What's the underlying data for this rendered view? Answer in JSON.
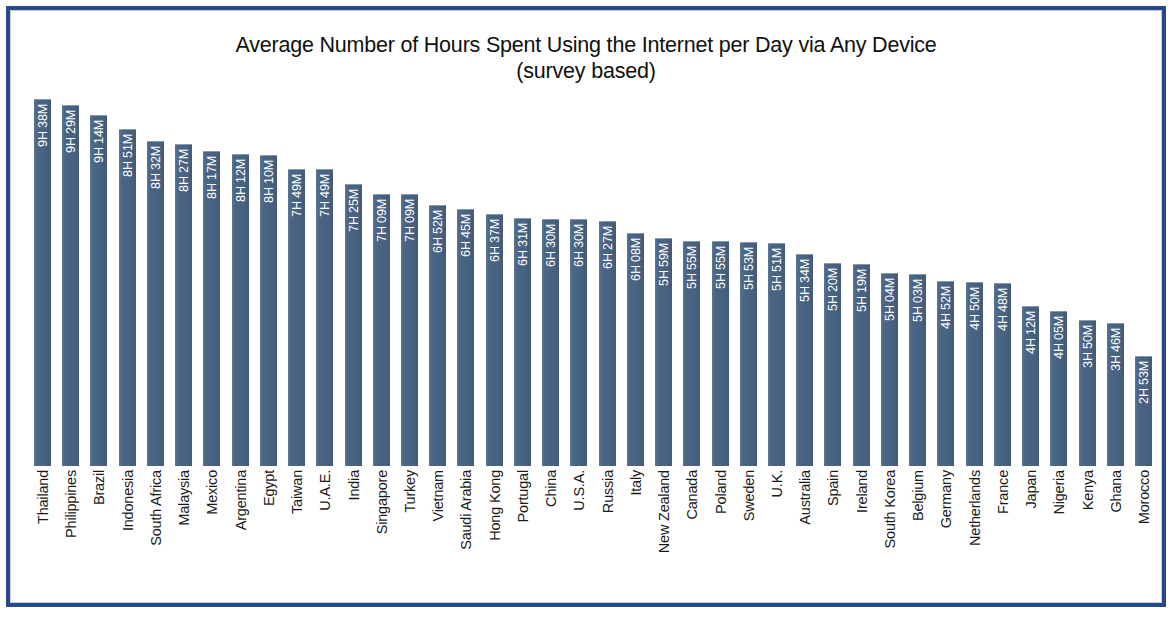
{
  "chart_data": {
    "type": "bar",
    "title": "Average Number of Hours Spent Using the Internet per Day via Any Device",
    "subtitle": "(survey based)",
    "xlabel": "",
    "ylabel": "",
    "orientation": "vertical",
    "grid": false,
    "legend": null,
    "value_label_position": "inside-bar-rotated",
    "ylim_hours": [
      0,
      10
    ],
    "categories": [
      "Thailand",
      "Philippines",
      "Brazil",
      "Indonesia",
      "South Africa",
      "Malaysia",
      "Mexico",
      "Argentina",
      "Egypt",
      "Taiwan",
      "U.A.E.",
      "India",
      "Singapore",
      "Turkey",
      "Vietnam",
      "Saudi Arabia",
      "Hong Kong",
      "Portugal",
      "China",
      "U.S.A.",
      "Russia",
      "Italy",
      "New Zealand",
      "Canada",
      "Poland",
      "Sweden",
      "U.K.",
      "Australia",
      "Spain",
      "Ireland",
      "South Korea",
      "Belgium",
      "Germany",
      "Netherlands",
      "France",
      "Japan",
      "Nigeria",
      "Kenya",
      "Ghana",
      "Morocco"
    ],
    "value_labels": [
      "9H 38M",
      "9H 29M",
      "9H 14M",
      "8H 51M",
      "8H 32M",
      "8H 27M",
      "8H 17M",
      "8H 12M",
      "8H 10M",
      "7H 49M",
      "7H 49M",
      "7H 25M",
      "7H 09M",
      "7H 09M",
      "6H 52M",
      "6H 45M",
      "6H 37M",
      "6H 31M",
      "6H 30M",
      "6H 30M",
      "6H 27M",
      "6H 08M",
      "5H 59M",
      "5H 55M",
      "5H 55M",
      "5H 53M",
      "5H 51M",
      "5H 34M",
      "5H 20M",
      "5H 19M",
      "5H 04M",
      "5H 03M",
      "4H 52M",
      "4H 50M",
      "4H 48M",
      "4H 12M",
      "4H 05M",
      "3H 50M",
      "3H 46M",
      "2H 53M"
    ],
    "values": [
      9.633,
      9.483,
      9.233,
      8.85,
      8.533,
      8.45,
      8.283,
      8.2,
      8.167,
      7.817,
      7.817,
      7.417,
      7.15,
      7.15,
      6.867,
      6.75,
      6.617,
      6.517,
      6.5,
      6.5,
      6.45,
      6.133,
      5.983,
      5.917,
      5.917,
      5.883,
      5.85,
      5.567,
      5.333,
      5.317,
      5.067,
      5.05,
      4.867,
      4.833,
      4.8,
      4.2,
      4.083,
      3.833,
      3.767,
      2.883
    ]
  },
  "colors": {
    "bar": "#4a6585",
    "frame": "#274a86",
    "background": "#ffffff",
    "title_text": "#101010",
    "value_text": "#ffffff",
    "category_text": "#1a1a1a"
  }
}
